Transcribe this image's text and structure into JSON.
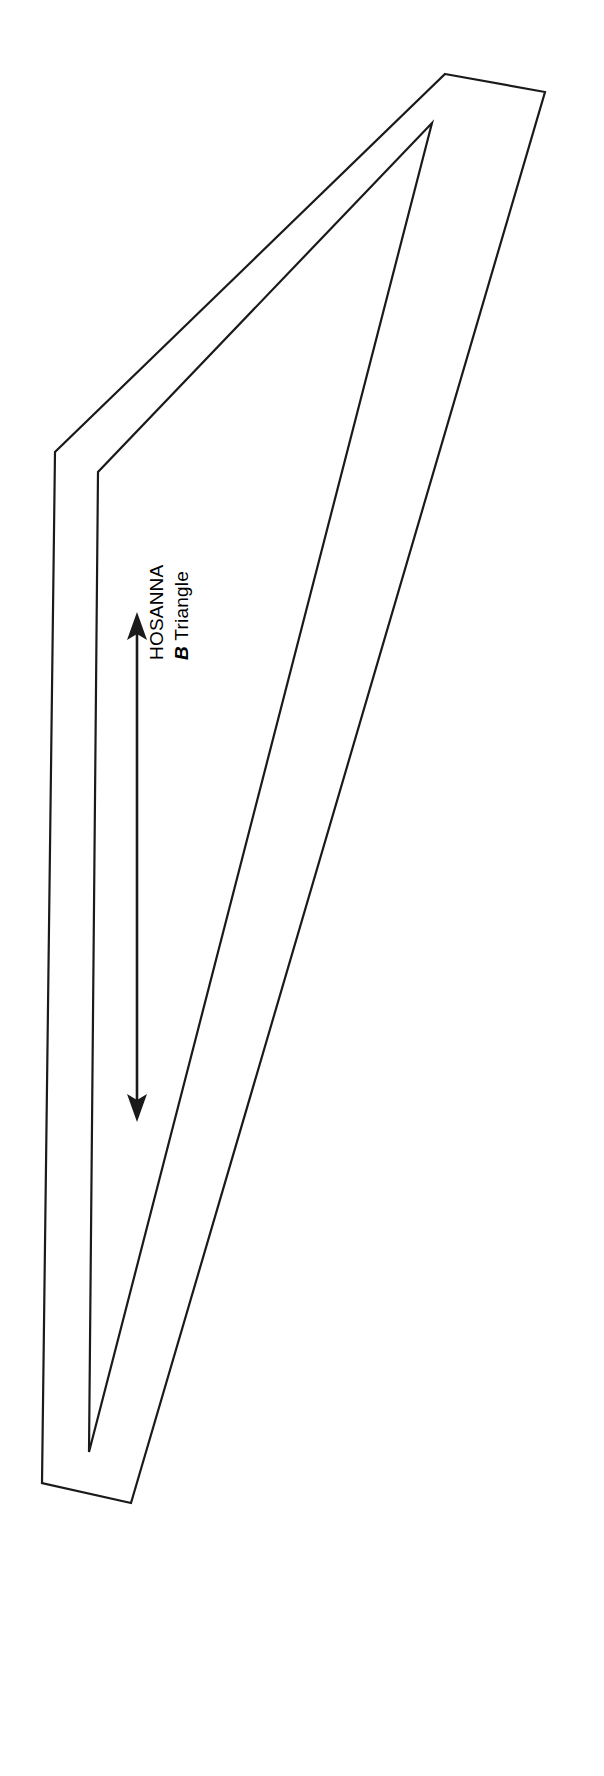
{
  "figure": {
    "title_text": "HOSANNA",
    "caption_prefix": "B",
    "caption_text": " Triangle",
    "label_rotation_deg": -90,
    "stroke_color": "#1a1a1a",
    "fill_color": "#ffffff",
    "background_color": "#ffffff",
    "line_width": 2,
    "canvas": {
      "width": 604,
      "height": 1776
    },
    "drawing": {
      "type": "outlined-triangle-sheet",
      "outer_path": [
        [
          446,
          74
        ],
        [
          545,
          92
        ],
        [
          88,
          1498
        ],
        [
          42,
          1482
        ],
        [
          131,
          1502
        ],
        [
          55,
          451
        ]
      ],
      "outer_polygon": [
        [
          445,
          74
        ],
        [
          545,
          92
        ],
        [
          131,
          1503
        ],
        [
          42,
          1483
        ],
        [
          55,
          452
        ]
      ],
      "inner_polygon": [
        [
          432,
          123
        ],
        [
          89,
          1452
        ],
        [
          98,
          472
        ]
      ],
      "description": "Elongated narrow triangular outline drawn twice (outer border and inner border) forming a thin band"
    },
    "dimension_arrow": {
      "type": "double-headed-arrow",
      "orientation": "vertical",
      "x": 137,
      "y_top": 614,
      "y_bottom": 1119,
      "head_length": 22,
      "head_half_width": 9,
      "shaft_width": 2
    }
  }
}
